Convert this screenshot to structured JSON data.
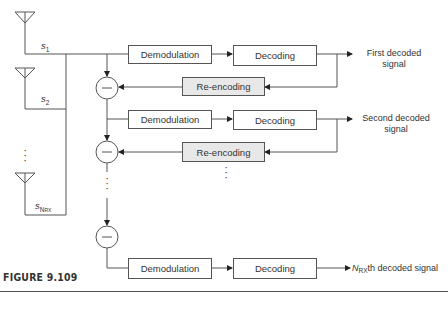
{
  "diagram": {
    "signals": {
      "s1": {
        "base": "s",
        "sub": "1"
      },
      "s2": {
        "base": "s",
        "sub": "2"
      },
      "sN": {
        "base": "s",
        "sub": "N",
        "subsub": "RX"
      }
    },
    "blocks": {
      "demod_label": "Demodulation",
      "decode_label": "Decoding",
      "reencode_label": "Re-encoding"
    },
    "outputs": {
      "first_line1": "First decoded",
      "first_line2": "signal",
      "second_line1": "Second decoded",
      "second_line2": "signal",
      "last_prefix": "N",
      "last_sub": "RX",
      "last_suffix": "th decoded signal"
    },
    "subtractor_symbol": "−",
    "ellipsis": "⋮"
  },
  "figure": {
    "caption": "FIGURE 9.109"
  },
  "colors": {
    "line": "#555555",
    "shaded_block": "#e8e8e8"
  }
}
